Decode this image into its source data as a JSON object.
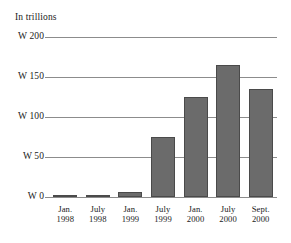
{
  "chart_data": {
    "type": "bar",
    "title": "In trillions",
    "xlabel": "",
    "ylabel": "",
    "currency_symbol": "W",
    "categories": [
      "Jan. 1998",
      "July 1998",
      "Jan. 1999",
      "July 1999",
      "Jan. 2000",
      "July 2000",
      "Sept. 2000"
    ],
    "category_lines": [
      [
        "Jan.",
        "1998"
      ],
      [
        "July",
        "1998"
      ],
      [
        "Jan.",
        "1999"
      ],
      [
        "July",
        "1999"
      ],
      [
        "Jan.",
        "2000"
      ],
      [
        "July",
        "2000"
      ],
      [
        "Sept.",
        "2000"
      ]
    ],
    "values": [
      1,
      2.5,
      6,
      75,
      125,
      165,
      135
    ],
    "ylim": [
      0,
      200
    ],
    "yticks": [
      0,
      50,
      100,
      150,
      200
    ],
    "ytick_labels": [
      "W 0",
      "W 50",
      "W 100",
      "W 150",
      "W 200"
    ],
    "grid": true,
    "legend": "none",
    "bar_color": "#6b6b6b",
    "bar_edge_color": "#4a4a4a",
    "gridline_color": "#8c8c8c",
    "text_color": "#1a1a1a",
    "background_color": "#ffffff"
  }
}
